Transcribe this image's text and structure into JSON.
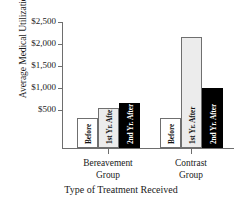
{
  "chart_data": {
    "type": "bar",
    "title": "",
    "xlabel": "Type of Treatment Received",
    "ylabel": "Average Medical Utilization",
    "categories": [
      "Bereavement Group",
      "Contrast Group"
    ],
    "category_lines": [
      [
        "Bereavement",
        "Group"
      ],
      [
        "Contrast",
        "Group"
      ]
    ],
    "series": [
      {
        "name": "Before",
        "values": [
          600,
          600
        ],
        "color": "#ffffff"
      },
      {
        "name": "1st Yr. After",
        "values": [
          800,
          2200
        ],
        "color": "#ececec"
      },
      {
        "name": "2nd Yr. After",
        "values": [
          900,
          1200
        ],
        "color": "#000000"
      }
    ],
    "ylim": [
      0,
      2500
    ],
    "yticks": [
      500,
      1000,
      1500,
      2000,
      2500
    ],
    "ytick_labels": [
      "$500",
      "$1,000",
      "$1,500",
      "$2,000",
      "$2,500"
    ],
    "grid": false,
    "legend": "in-bar-labels"
  },
  "bars": [
    {
      "group": "Bereavement Group",
      "label": "Before",
      "value": 600,
      "style": "white"
    },
    {
      "group": "Bereavement Group",
      "label": "1st Yr. After",
      "value": 800,
      "style": "gray"
    },
    {
      "group": "Bereavement Group",
      "label": "2nd Yr. After",
      "value": 900,
      "style": "black"
    },
    {
      "group": "Contrast Group",
      "label": "Before",
      "value": 600,
      "style": "white"
    },
    {
      "group": "Contrast Group",
      "label": "1st Yr. After",
      "value": 2200,
      "style": "gray"
    },
    {
      "group": "Contrast Group",
      "label": "2nd Yr. After",
      "value": 1200,
      "style": "black"
    }
  ]
}
